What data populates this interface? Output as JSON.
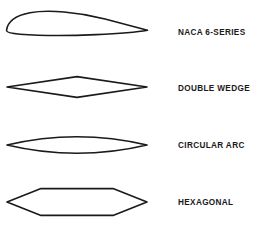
{
  "figure": {
    "background_color": "#ffffff",
    "line_color": "#1a1a1a",
    "width": 263,
    "height": 234
  },
  "profiles": [
    {
      "id": "naca-6-series",
      "label": "NACA 6-SERIES",
      "description": "Cambered subsonic airfoil with rounded leading edge and sharp trailing edge",
      "leading_edge": "rounded",
      "trailing_edge": "sharp",
      "symmetry": "cambered"
    },
    {
      "id": "double-wedge",
      "label": "DOUBLE WEDGE",
      "description": "Diamond shaped supersonic profile with maximum thickness at mid chord",
      "leading_edge": "sharp",
      "trailing_edge": "sharp",
      "symmetry": "symmetric"
    },
    {
      "id": "circular-arc",
      "label": "CIRCULAR ARC",
      "description": "Biconvex lens profile formed by two circular arcs",
      "leading_edge": "sharp",
      "trailing_edge": "sharp",
      "symmetry": "symmetric"
    },
    {
      "id": "hexagonal",
      "label": "HEXAGONAL",
      "description": "Six sided profile with flat upper and lower mid sections and sharp ends",
      "leading_edge": "sharp",
      "trailing_edge": "sharp",
      "symmetry": "symmetric"
    }
  ]
}
